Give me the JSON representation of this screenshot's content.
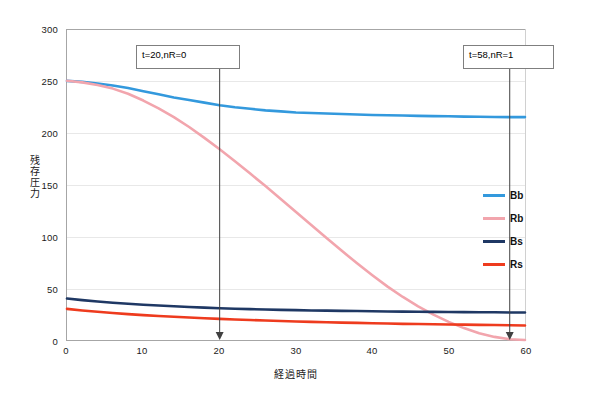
{
  "chart_data": {
    "type": "line",
    "title": "",
    "xlabel": "経過時間",
    "ylabel": "残存圧力",
    "xlim": [
      0,
      60
    ],
    "ylim": [
      0,
      300
    ],
    "xticks": [
      0,
      10,
      20,
      30,
      40,
      50,
      60
    ],
    "yticks": [
      0,
      50,
      100,
      150,
      200,
      250,
      300
    ],
    "grid": true,
    "legend_position": "inside-right",
    "x": [
      0,
      2,
      4,
      6,
      8,
      10,
      12,
      14,
      16,
      18,
      20,
      22,
      24,
      26,
      28,
      30,
      32,
      34,
      36,
      38,
      40,
      42,
      44,
      46,
      48,
      50,
      52,
      54,
      56,
      58,
      60
    ],
    "series": [
      {
        "name": "Bb",
        "color": "#3399DD",
        "values": [
          250,
          249,
          247.5,
          245.5,
          243,
          240,
          237,
          234,
          231.5,
          229,
          226.5,
          224.5,
          223,
          221.5,
          220.5,
          219.5,
          219,
          218.5,
          218,
          217.5,
          217,
          216.8,
          216.5,
          216.2,
          216,
          215.8,
          215.5,
          215.3,
          215.1,
          215,
          215
        ]
      },
      {
        "name": "Rb",
        "color": "#F2A5AD",
        "values": [
          250,
          248.5,
          246,
          242.5,
          237.5,
          231,
          223.5,
          215,
          205.5,
          195,
          184,
          172.5,
          160.5,
          148.5,
          136,
          123.5,
          111,
          98.5,
          86,
          74,
          62.5,
          51.5,
          41.5,
          32.5,
          24.5,
          17.5,
          11.5,
          6.5,
          3,
          0.8,
          0
        ]
      },
      {
        "name": "Bs",
        "color": "#1F3864",
        "values": [
          40,
          38.5,
          37.2,
          36,
          35,
          34,
          33.2,
          32.5,
          31.8,
          31.2,
          30.7,
          30.2,
          29.8,
          29.4,
          29.1,
          28.8,
          28.5,
          28.3,
          28.1,
          27.9,
          27.7,
          27.5,
          27.4,
          27.2,
          27.1,
          27,
          26.9,
          26.8,
          26.7,
          26.6,
          26.5
        ]
      },
      {
        "name": "Rs",
        "color": "#EE3B1E",
        "values": [
          30,
          28.5,
          27.2,
          26,
          25,
          24,
          23.2,
          22.4,
          21.7,
          21,
          20.4,
          19.8,
          19.3,
          18.8,
          18.3,
          17.9,
          17.5,
          17.1,
          16.8,
          16.5,
          16.2,
          15.9,
          15.6,
          15.4,
          15.2,
          15,
          14.8,
          14.6,
          14.4,
          14.2,
          14
        ]
      }
    ],
    "annotations": [
      {
        "label": "t=20,nR=0",
        "x": 20,
        "arrow_to_y": 0
      },
      {
        "label": "t=58,nR=1",
        "x": 58,
        "arrow_to_y": 0
      }
    ]
  },
  "axes": {
    "y_tick_labels": [
      "300",
      "250",
      "200",
      "150",
      "100",
      "50",
      "0"
    ],
    "x_tick_labels": [
      "0",
      "10",
      "20",
      "30",
      "40",
      "50",
      "60"
    ],
    "y_title": "残存圧力",
    "x_title": "経過時間"
  },
  "legend": {
    "items": [
      {
        "label": "Bb",
        "color": "#3399DD"
      },
      {
        "label": "Rb",
        "color": "#F2A5AD"
      },
      {
        "label": "Bs",
        "color": "#1F3864"
      },
      {
        "label": "Rs",
        "color": "#EE3B1E"
      }
    ]
  },
  "annotations": {
    "left": {
      "text": "t=20,nR=0"
    },
    "right": {
      "text": "t=58,nR=1"
    }
  },
  "colors": {
    "bb": "#3399DD",
    "rb": "#F2A5AD",
    "bs": "#1F3864",
    "rs": "#EE3B1E",
    "axis": "#A6A6A6",
    "grid": "#E8E8E8",
    "annotation_line": "#404040"
  }
}
